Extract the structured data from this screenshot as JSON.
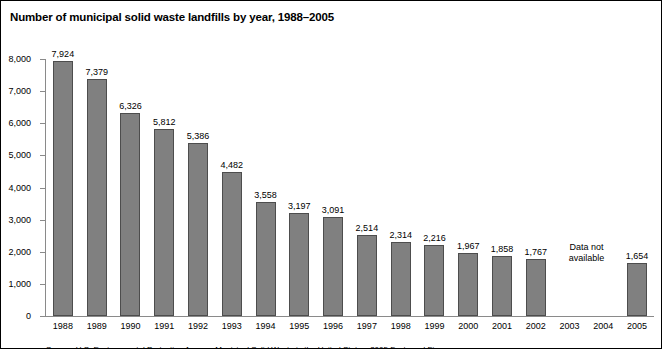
{
  "figure": {
    "title": "Number of municipal solid waste landfills by year, 1988–2005",
    "footnote": "Source: U.S. Environmental Protection Agency, Municipal Solid Waste in the United States: 2005 Facts and Figures."
  },
  "axis": {
    "y_ticks": [
      "8,000",
      "7,000",
      "6,000",
      "5,000",
      "4,000",
      "3,000",
      "2,000",
      "1,000",
      "0"
    ],
    "y_tick_values": [
      8000,
      7000,
      6000,
      5000,
      4000,
      3000,
      2000,
      1000,
      0
    ],
    "na_label_line1": "Data not",
    "na_label_line2": "available"
  },
  "colors": {
    "bar_fill": "#808080",
    "bar_stroke": "#4d4d4d",
    "axis": "#8a8a8a",
    "text": "#000000",
    "background": "#ffffff",
    "border": "#000000"
  },
  "chart_data": {
    "type": "bar",
    "title": "Number of municipal solid waste landfills by year, 1988–2005",
    "xlabel": "",
    "ylabel": "",
    "ylim": [
      0,
      8000
    ],
    "ytick_interval": 1000,
    "grid": false,
    "legend": null,
    "categories": [
      "1988",
      "1989",
      "1990",
      "1991",
      "1992",
      "1993",
      "1994",
      "1995",
      "1996",
      "1997",
      "1998",
      "1999",
      "2000",
      "2001",
      "2002",
      "2003",
      "2004",
      "2005"
    ],
    "values": [
      7924,
      7379,
      6326,
      5812,
      5386,
      4482,
      3558,
      3197,
      3091,
      2514,
      2314,
      2216,
      1967,
      1858,
      1767,
      null,
      null,
      1654
    ],
    "value_labels": [
      "7,924",
      "7,379",
      "6,326",
      "5,812",
      "5,386",
      "4,482",
      "3,558",
      "3,197",
      "3,091",
      "2,514",
      "2,314",
      "2,216",
      "1,967",
      "1,858",
      "1,767",
      "",
      "",
      "1,654"
    ],
    "annotations": [
      {
        "text": "Data not available",
        "covers": [
          "2003",
          "2004"
        ]
      }
    ]
  }
}
